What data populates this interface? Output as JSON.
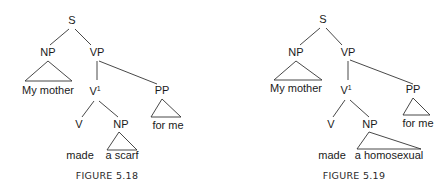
{
  "figures": [
    {
      "caption": "FIGURE 5.18",
      "nodes": {
        "s": "S",
        "np_subject": "NP",
        "vp": "VP",
        "v_bar": "V",
        "v_bar_sup": "1",
        "pp": "PP",
        "v": "V",
        "np_object": "NP"
      },
      "leaves": {
        "subject": "My mother",
        "verb": "made",
        "object": "a scarf",
        "pp": "for me"
      }
    },
    {
      "caption": "FIGURE 5.19",
      "nodes": {
        "s": "S",
        "np_subject": "NP",
        "vp": "VP",
        "v_bar": "V",
        "v_bar_sup": "1",
        "pp": "PP",
        "v": "V",
        "np_object": "NP"
      },
      "leaves": {
        "subject": "My mother",
        "verb": "made",
        "object": "a homosexual",
        "pp": "for me"
      }
    }
  ]
}
